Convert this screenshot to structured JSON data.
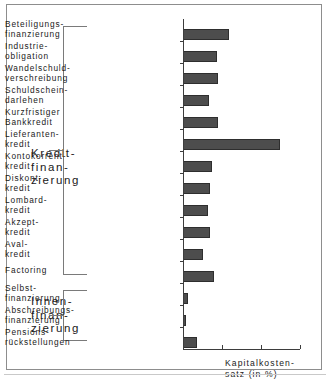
{
  "chart_data": {
    "type": "bar",
    "orientation": "horizontal",
    "title": "",
    "xlabel": "Kapitalkostensatz (in %)",
    "ylabel": "",
    "grid": false,
    "legend": null,
    "xlim": [
      0,
      6
    ],
    "xticks": [
      0,
      2,
      4,
      6
    ],
    "axis_origin_px": 182,
    "axis_end_px": 299,
    "categories": [
      "Beteiligungs-\nfinanzierung",
      "Industrie-\nobligation",
      "Wandelschuld-\nverschreibung",
      "Schuldschein-\ndarlehen",
      "Kurzfristiger\nBankkredit",
      "Lieferanten-\nkredit",
      "Kontokorrent-\nkredit",
      "Diskont-\nkredit",
      "Lombard-\nkredit",
      "Akzept-\nkredit",
      "Aval-\nkredit",
      "Factoring",
      "Selbst-\nfinanzierung",
      "Abschreibungs-\nfinanzierung",
      "Pensions-\nrückstellungen"
    ],
    "values": [
      2.36,
      1.74,
      1.79,
      1.33,
      1.79,
      4.97,
      1.49,
      1.38,
      1.28,
      1.38,
      1.02,
      1.59,
      0.26,
      0.15,
      0.72
    ],
    "bar_color": "#4d4d4d"
  },
  "figure": {
    "groups": [
      {
        "label": "Kredit-\nfinan-\nzierung",
        "items_from": 0,
        "items_to": 11
      },
      {
        "label": "Innen-\nfinan-\nzierung",
        "items_from": 12,
        "items_to": 14
      }
    ],
    "axis_title": "Kapitalkosten-\nsatz (in %)"
  }
}
